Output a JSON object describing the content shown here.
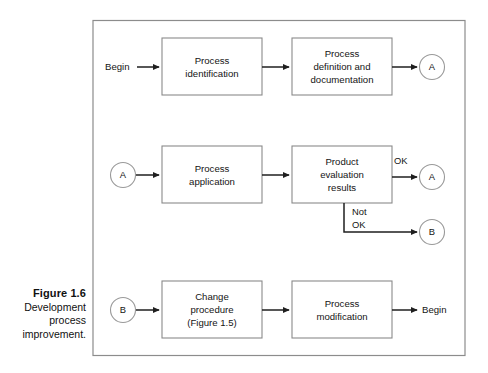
{
  "figure": {
    "caption_title": "Figure 1.6",
    "caption_body": "Development process improvement.",
    "caption_line_1": "Development",
    "caption_line_2": "process",
    "caption_line_3": "improvement."
  },
  "colors": {
    "background": "#ffffff",
    "frame_stroke": "#8c8c8c",
    "box_stroke": "#8a8a8a",
    "circle_stroke": "#9a9a9a",
    "arrow": "#1f1f1f",
    "text": "#141414"
  },
  "diagram": {
    "rows": [
      {
        "id": "row-1",
        "start_terminal": "Begin",
        "boxes": [
          {
            "id": "process-identification",
            "lines": [
              "Process",
              "identification"
            ]
          },
          {
            "id": "process-definition",
            "lines": [
              "Process",
              "definition and",
              "documentation"
            ]
          }
        ],
        "end_connector": "A"
      },
      {
        "id": "row-2",
        "start_connector": "A",
        "boxes": [
          {
            "id": "process-application",
            "lines": [
              "Process",
              "application"
            ]
          },
          {
            "id": "product-evaluation",
            "lines": [
              "Product",
              "evaluation",
              "results"
            ]
          }
        ],
        "branches": [
          {
            "id": "branch-ok",
            "label_lines": [
              "OK"
            ],
            "target": "A"
          },
          {
            "id": "branch-not-ok",
            "label_lines": [
              "Not",
              "OK"
            ],
            "target": "B"
          }
        ]
      },
      {
        "id": "row-3",
        "start_connector": "B",
        "boxes": [
          {
            "id": "change-procedure",
            "lines": [
              "Change",
              "procedure",
              "(Figure 1.5)"
            ]
          },
          {
            "id": "process-modification",
            "lines": [
              "Process",
              "modification"
            ]
          }
        ],
        "end_terminal": "Begin"
      }
    ]
  }
}
